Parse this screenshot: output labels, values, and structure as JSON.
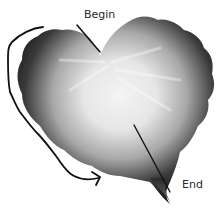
{
  "diagram": {
    "labels": {
      "begin": "Begin",
      "end": "End"
    },
    "elements": [
      {
        "type": "leaf-shape",
        "description": "heart-shaped leaf with dark scalloped edges and light center"
      },
      {
        "type": "pointer-line",
        "target": "begin",
        "description": "line from Begin label to leaf notch at top"
      },
      {
        "type": "pointer-line",
        "target": "end",
        "description": "line from leaf center down to leaf tip near End label"
      },
      {
        "type": "curved-arrow",
        "description": "hand-drawn arrow tracing the left edge of the leaf from top toward bottom"
      }
    ],
    "colors": {
      "leaf_dark": "#141414",
      "leaf_light": "#f2f2f2",
      "stroke": "#111111",
      "background": "#ffffff"
    }
  }
}
